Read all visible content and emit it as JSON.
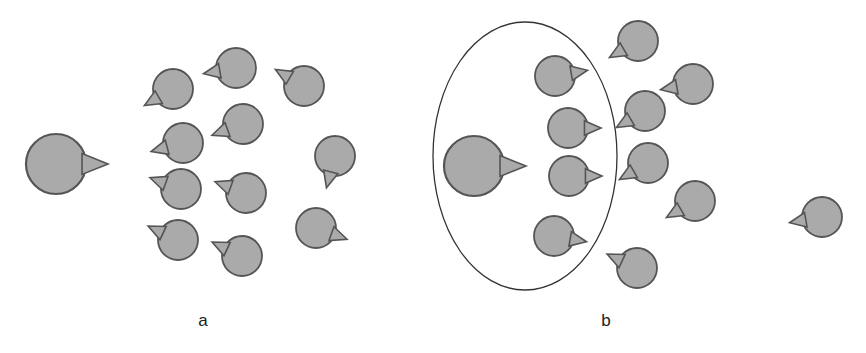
{
  "figure": {
    "style": {
      "agent_fill": "#aaaaaa",
      "agent_stroke": "#555555",
      "ellipse_stroke": "#333333",
      "background": "#ffffff"
    },
    "panels": [
      {
        "id": "a",
        "label": "a",
        "label_pos": [
          203,
          326
        ],
        "leader": {
          "cx": 56,
          "cy": 164,
          "r": 30,
          "heading_deg": 0
        },
        "ellipse": null,
        "agents": [
          {
            "cx": 173,
            "cy": 89,
            "r": 20,
            "heading_deg": 150
          },
          {
            "cx": 236,
            "cy": 68,
            "r": 20,
            "heading_deg": 170
          },
          {
            "cx": 304,
            "cy": 86,
            "r": 20,
            "heading_deg": 210
          },
          {
            "cx": 183,
            "cy": 143,
            "r": 20,
            "heading_deg": 165
          },
          {
            "cx": 243,
            "cy": 124,
            "r": 20,
            "heading_deg": 160
          },
          {
            "cx": 335,
            "cy": 156,
            "r": 20,
            "heading_deg": 105
          },
          {
            "cx": 181,
            "cy": 189,
            "r": 20,
            "heading_deg": 200
          },
          {
            "cx": 246,
            "cy": 193,
            "r": 20,
            "heading_deg": 200
          },
          {
            "cx": 178,
            "cy": 240,
            "r": 20,
            "heading_deg": 205
          },
          {
            "cx": 316,
            "cy": 228,
            "r": 20,
            "heading_deg": 20
          },
          {
            "cx": 242,
            "cy": 256,
            "r": 20,
            "heading_deg": 205
          }
        ]
      },
      {
        "id": "b",
        "label": "b",
        "label_pos": [
          606,
          326
        ],
        "leader": {
          "cx": 474,
          "cy": 166,
          "r": 30,
          "heading_deg": 0
        },
        "ellipse": {
          "cx": 525,
          "cy": 156,
          "rx": 92,
          "ry": 134
        },
        "agents": [
          {
            "cx": 555,
            "cy": 76,
            "r": 20,
            "heading_deg": -10
          },
          {
            "cx": 568,
            "cy": 128,
            "r": 20,
            "heading_deg": 0
          },
          {
            "cx": 569,
            "cy": 176,
            "r": 20,
            "heading_deg": 0
          },
          {
            "cx": 554,
            "cy": 236,
            "r": 20,
            "heading_deg": 10
          },
          {
            "cx": 638,
            "cy": 41,
            "r": 20,
            "heading_deg": 150
          },
          {
            "cx": 693,
            "cy": 84,
            "r": 20,
            "heading_deg": 170
          },
          {
            "cx": 645,
            "cy": 111,
            "r": 20,
            "heading_deg": 150
          },
          {
            "cx": 648,
            "cy": 163,
            "r": 20,
            "heading_deg": 150
          },
          {
            "cx": 695,
            "cy": 201,
            "r": 20,
            "heading_deg": 150
          },
          {
            "cx": 822,
            "cy": 217,
            "r": 20,
            "heading_deg": 170
          },
          {
            "cx": 637,
            "cy": 268,
            "r": 20,
            "heading_deg": 205
          }
        ]
      }
    ],
    "caption": {
      "text": "",
      "note": "caption line cut off at bottom edge; illegible"
    }
  }
}
